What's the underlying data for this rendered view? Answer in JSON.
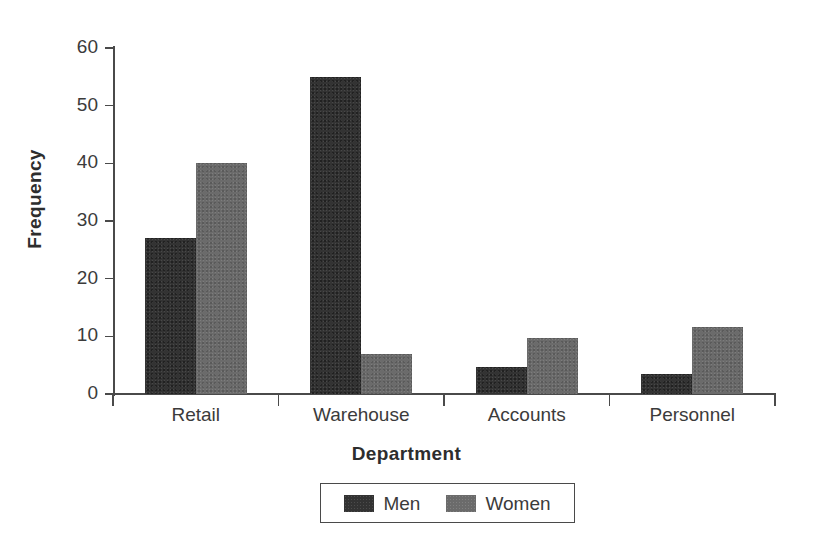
{
  "chart_data": {
    "type": "bar",
    "title": "",
    "subtitle": "",
    "xlabel": "Department",
    "ylabel": "Frequency",
    "categories": [
      "Retail",
      "Warehouse",
      "Accounts",
      "Personnel"
    ],
    "series": [
      {
        "name": "Men",
        "color": "#333333",
        "values": [
          27,
          55,
          4.7,
          3.5
        ]
      },
      {
        "name": "Women",
        "color": "#6b6b6b",
        "values": [
          40,
          7,
          9.7,
          11.7
        ]
      }
    ],
    "ylim": [
      0,
      60
    ],
    "ytick_values": [
      0,
      10,
      20,
      30,
      40,
      50,
      60
    ],
    "ytick_labels": [
      "0",
      "10",
      "20",
      "30",
      "40",
      "50",
      "60"
    ],
    "grid": false,
    "legend_position": "bottom-center",
    "legend_entries": [
      "Men",
      "Women"
    ],
    "bar_group_style": "grouped",
    "background_color": "#ffffff",
    "axis_color": "#4a4a4a"
  }
}
